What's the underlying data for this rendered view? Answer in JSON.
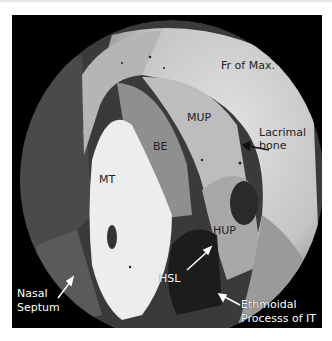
{
  "figure": {
    "labels": {
      "fr_of_max": "Fr of Max.",
      "mup": "MUP",
      "lacrimal_bone_1": "Lacrimal",
      "lacrimal_bone_2": "bone",
      "be": "BE",
      "mt": "MT",
      "hup": "HUP",
      "hsl": "HSL",
      "nasal_septum_1": "Nasal",
      "nasal_septum_2": "Septum",
      "ethmoidal_1": "Ethmoidal",
      "ethmoidal_2": "Processs of IT"
    }
  }
}
